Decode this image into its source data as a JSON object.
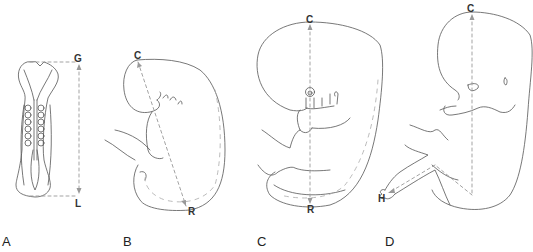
{
  "figure": {
    "panels": [
      {
        "id": "A",
        "label": "A",
        "measurement": "greatest length",
        "start_point": "G",
        "end_point": "L"
      },
      {
        "id": "B",
        "label": "B",
        "measurement": "crown-rump length",
        "start_point": "C",
        "end_point": "R"
      },
      {
        "id": "C",
        "label": "C",
        "measurement": "crown-rump length",
        "start_point": "C",
        "end_point": "R"
      },
      {
        "id": "D",
        "label": "D",
        "measurement": "crown-heel length",
        "start_point": "C",
        "end_point": "H"
      }
    ],
    "colors": {
      "outline": "#555555",
      "measure_line": "#9a9a9a",
      "text": "#222222",
      "background": "#ffffff"
    }
  }
}
